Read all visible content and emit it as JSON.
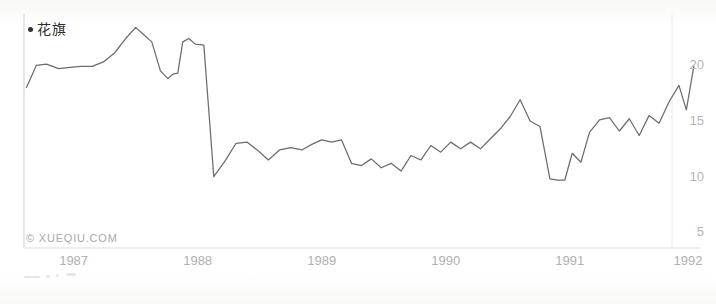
{
  "legend": {
    "marker": "bullet-dot",
    "label": "花旗"
  },
  "watermark": {
    "text": "© XUEQIU.COM"
  },
  "chart_data": {
    "type": "line",
    "title": "",
    "subtitle": "",
    "xlabel": "",
    "ylabel": "",
    "series_name": "花旗",
    "line_color": "#6f6b66",
    "grid": false,
    "legend_position": "top-left",
    "y_axis_side": "right",
    "ylim": [
      3.5,
      24.5
    ],
    "yticks": [
      5,
      10,
      15,
      20
    ],
    "ytick_labels": [
      "5",
      "10",
      "15",
      "20"
    ],
    "xlim": [
      1986.6,
      1992.05
    ],
    "xticks": [
      1987,
      1988,
      1989,
      1990,
      1991,
      1992
    ],
    "xtick_labels": [
      "1987",
      "1988",
      "1989",
      "1990",
      "1991",
      "1992"
    ],
    "x": [
      1986.62,
      1986.7,
      1986.78,
      1986.88,
      1986.97,
      1987.06,
      1987.15,
      1987.24,
      1987.33,
      1987.42,
      1987.5,
      1987.57,
      1987.63,
      1987.7,
      1987.76,
      1987.8,
      1987.84,
      1987.88,
      1987.93,
      1987.98,
      1988.05,
      1988.13,
      1988.22,
      1988.31,
      1988.4,
      1988.49,
      1988.57,
      1988.66,
      1988.75,
      1988.84,
      1988.92,
      1989.0,
      1989.08,
      1989.16,
      1989.24,
      1989.32,
      1989.4,
      1989.48,
      1989.56,
      1989.64,
      1989.72,
      1989.8,
      1989.88,
      1989.96,
      1990.04,
      1990.12,
      1990.2,
      1990.28,
      1990.36,
      1990.44,
      1990.52,
      1990.6,
      1990.68,
      1990.76,
      1990.84,
      1990.9,
      1990.96,
      1991.02,
      1991.09,
      1991.16,
      1991.24,
      1991.32,
      1991.4,
      1991.48,
      1991.56,
      1991.64,
      1991.72,
      1991.8,
      1991.88,
      1991.94,
      1992.0
    ],
    "values": [
      17.9,
      19.9,
      20.0,
      19.6,
      19.7,
      19.8,
      19.8,
      20.2,
      21.0,
      22.3,
      23.3,
      22.6,
      22.0,
      19.4,
      18.7,
      19.1,
      19.2,
      22.0,
      22.3,
      21.8,
      21.7,
      9.9,
      11.3,
      12.9,
      13.0,
      12.2,
      11.4,
      12.3,
      12.5,
      12.3,
      12.8,
      13.2,
      13.0,
      13.2,
      11.1,
      10.9,
      11.5,
      10.7,
      11.1,
      10.4,
      11.8,
      11.4,
      12.7,
      12.1,
      13.0,
      12.4,
      13.0,
      12.4,
      13.3,
      14.2,
      15.3,
      16.8,
      14.9,
      14.4,
      9.7,
      9.6,
      9.6,
      12.0,
      11.2,
      13.9,
      15.0,
      15.2,
      14.0,
      15.1,
      13.6,
      15.4,
      14.7,
      16.6,
      18.1,
      15.9,
      19.8
    ],
    "annotations": [
      {
        "label": "1987 crash",
        "x": 1988.13,
        "y": 9.9
      },
      {
        "label": "1990 low",
        "x": 1990.9,
        "y": 9.6
      },
      {
        "label": "1992 high",
        "x": 1992.0,
        "y": 19.8
      }
    ]
  }
}
